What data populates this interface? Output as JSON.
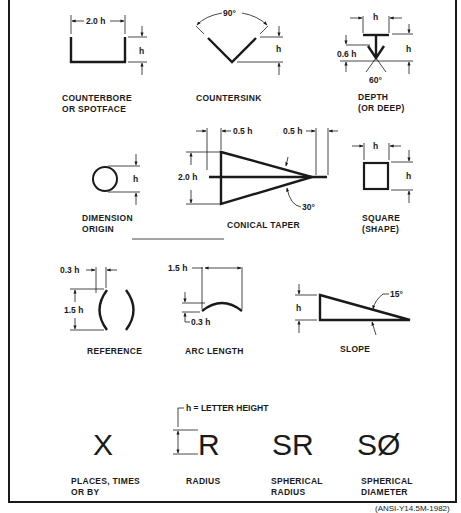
{
  "symbols": {
    "counterbore": {
      "label_line1": "COUNTERBORE",
      "label_line2": "OR SPOTFACE",
      "dim_width": "2.0 h",
      "dim_height": "h"
    },
    "countersink": {
      "label": "COUNTERSINK",
      "angle": "90°",
      "dim_height": "h"
    },
    "depth": {
      "label_line1": "DEPTH",
      "label_line2": "(OR DEEP)",
      "dim_width": "h",
      "dim_height": "h",
      "dim_stem": "0.6 h",
      "angle": "60°"
    },
    "dimension_origin": {
      "label_line1": "DIMENSION",
      "label_line2": "ORIGIN",
      "dim_height": "h"
    },
    "conical_taper": {
      "label": "CONICAL TAPER",
      "dim_left": "0.5 h",
      "dim_right": "0.5 h",
      "dim_height": "2.0 h",
      "angle": "30°"
    },
    "square": {
      "label_line1": "SQUARE",
      "label_line2": "(SHAPE)",
      "dim_width": "h",
      "dim_height": "h"
    },
    "reference": {
      "label": "REFERENCE",
      "dim_gap": "0.3 h",
      "dim_height": "1.5 h"
    },
    "arc_length": {
      "label": "ARC LENGTH",
      "dim_width": "1.5 h",
      "dim_rise": "0.3 h"
    },
    "slope": {
      "label": "SLOPE",
      "angle": "15°",
      "dim_height": "h"
    },
    "letter_height_note": "h = LETTER HEIGHT",
    "places": {
      "glyph": "X",
      "label_line1": "PLACES, TIMES",
      "label_line2": "OR BY"
    },
    "radius": {
      "glyph": "R",
      "label": "RADIUS"
    },
    "spherical_radius": {
      "glyph": "SR",
      "label_line1": "SPHERICAL",
      "label_line2": "RADIUS"
    },
    "spherical_diameter": {
      "glyph": "SØ",
      "label_line1": "SPHERICAL",
      "label_line2": "DIAMETER"
    }
  },
  "caption": "(ANSI-Y14.5M-1982)"
}
